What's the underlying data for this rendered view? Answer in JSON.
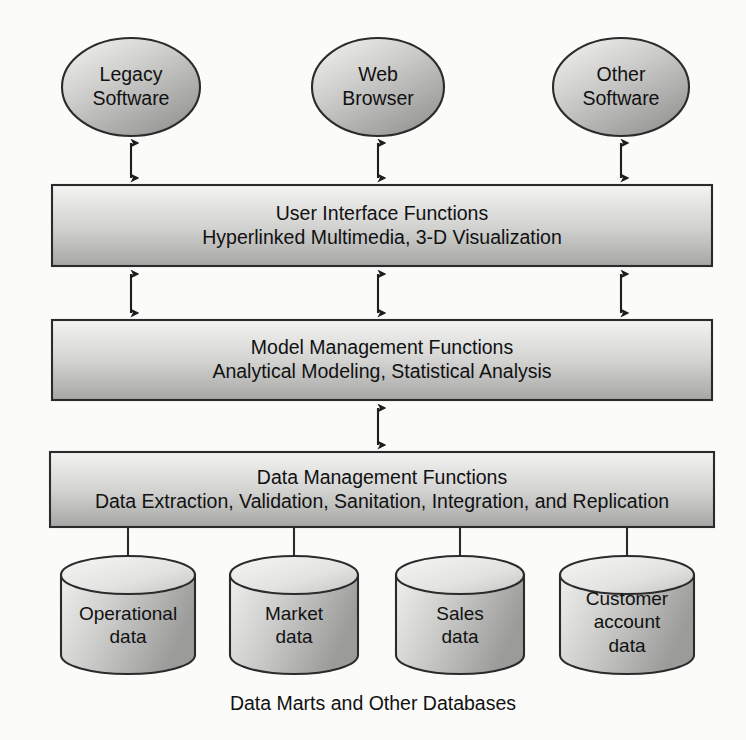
{
  "diagram": {
    "title": "Data Marts and Other Databases",
    "caption": "Data Marts and Other Databases",
    "colors": {
      "background": "#fbfbfa",
      "stroke": "#2b2b2b",
      "fill_light": "#f2f2f1",
      "fill_dark": "#9a9a9a",
      "text": "#111111"
    },
    "clients": [
      {
        "id": "legacy-software",
        "line1": "Legacy",
        "line2": "Software"
      },
      {
        "id": "web-browser",
        "line1": "Web",
        "line2": "Browser"
      },
      {
        "id": "other-software",
        "line1": "Other",
        "line2": "Software"
      }
    ],
    "layers": [
      {
        "id": "user-interface-functions",
        "line1": "User Interface Functions",
        "line2": "Hyperlinked Multimedia, 3-D Visualization"
      },
      {
        "id": "model-management-functions",
        "line1": "Model Management Functions",
        "line2": "Analytical Modeling, Statistical Analysis"
      },
      {
        "id": "data-management-functions",
        "line1": "Data Management Functions",
        "line2": "Data Extraction, Validation, Sanitation, Integration, and Replication"
      }
    ],
    "databases": [
      {
        "id": "operational-data",
        "line1": "Operational",
        "line2": "data",
        "line3": ""
      },
      {
        "id": "market-data",
        "line1": "Market",
        "line2": "data",
        "line3": ""
      },
      {
        "id": "sales-data",
        "line1": "Sales",
        "line2": "data",
        "line3": ""
      },
      {
        "id": "customer-account-data",
        "line1": "Customer",
        "line2": "account",
        "line3": "data"
      }
    ]
  }
}
